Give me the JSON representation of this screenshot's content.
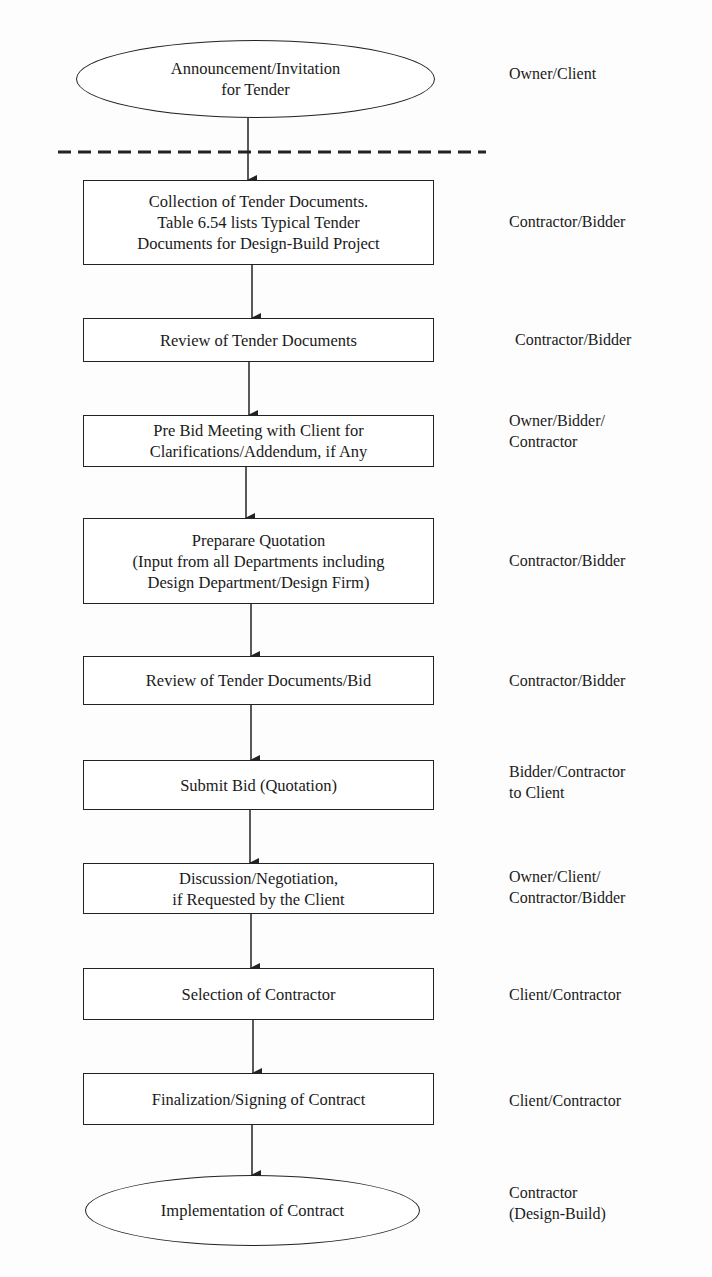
{
  "flowchart": {
    "nodes": [
      {
        "id": "announcement",
        "shape": "oval",
        "text": "Announcement/Invitation\nfor Tender",
        "role": "Owner/Client"
      },
      {
        "id": "collection",
        "shape": "box",
        "text": "Collection of Tender Documents.\nTable 6.54 lists Typical Tender\nDocuments for Design-Build Project",
        "role": "Contractor/Bidder"
      },
      {
        "id": "review",
        "shape": "box",
        "text": "Review of Tender Documents",
        "role": "Contractor/Bidder"
      },
      {
        "id": "prebid",
        "shape": "box",
        "text": "Pre Bid Meeting with Client for\nClarifications/Addendum, if Any",
        "role": "Owner/Bidder/\nContractor"
      },
      {
        "id": "quotation",
        "shape": "box",
        "text": "Preparare Quotation\n(Input from all Departments including\nDesign Department/Design Firm)",
        "role": "Contractor/Bidder"
      },
      {
        "id": "review-bid",
        "shape": "box",
        "text": "Review of Tender Documents/Bid",
        "role": "Contractor/Bidder"
      },
      {
        "id": "submit",
        "shape": "box",
        "text": "Submit Bid (Quotation)",
        "role": "Bidder/Contractor\nto Client"
      },
      {
        "id": "negotiation",
        "shape": "box",
        "text": "Discussion/Negotiation,\nif Requested by the Client",
        "role": "Owner/Client/\nContractor/Bidder"
      },
      {
        "id": "selection",
        "shape": "box",
        "text": "Selection of Contractor",
        "role": "Client/Contractor"
      },
      {
        "id": "signing",
        "shape": "box",
        "text": "Finalization/Signing of Contract",
        "role": "Client/Contractor"
      },
      {
        "id": "implementation",
        "shape": "oval",
        "text": "Implementation of Contract",
        "role": "Contractor\n(Design-Build)"
      }
    ],
    "edges": [
      [
        "announcement",
        "collection"
      ],
      [
        "collection",
        "review"
      ],
      [
        "review",
        "prebid"
      ],
      [
        "prebid",
        "quotation"
      ],
      [
        "quotation",
        "review-bid"
      ],
      [
        "review-bid",
        "submit"
      ],
      [
        "submit",
        "negotiation"
      ],
      [
        "negotiation",
        "selection"
      ],
      [
        "selection",
        "signing"
      ],
      [
        "signing",
        "implementation"
      ]
    ],
    "separator": "dashed line between Owner/Client phase and Contractor/Bidder phase"
  },
  "colors": {
    "line": "#222222",
    "background": "#ffffff"
  }
}
